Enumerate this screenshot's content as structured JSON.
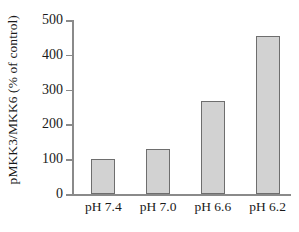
{
  "chart_data": {
    "type": "bar",
    "title": "",
    "subtitle": "",
    "xlabel": "",
    "ylabel": "pMKK3/MKK6 (% of control)",
    "categories": [
      "pH 7.4",
      "pH 7.0",
      "pH 6.6",
      "pH 6.2"
    ],
    "values": [
      102,
      129,
      268,
      453
    ],
    "ylim": [
      0,
      500
    ],
    "yticks": [
      0,
      100,
      200,
      300,
      400,
      500
    ],
    "ytick_labels": [
      "0",
      "100",
      "200",
      "300",
      "400",
      "500"
    ],
    "grid": false,
    "legend": null,
    "legend_position": "none",
    "bar_fill_color": "#d2d2d2",
    "bar_edge_color": "#6e6e6e",
    "axis_color": "#8a8a8a",
    "background_color": "#ffffff",
    "annotations": []
  }
}
